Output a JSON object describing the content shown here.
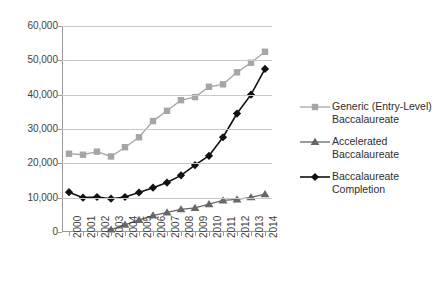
{
  "chart_data": {
    "type": "line",
    "title": "",
    "subtitle": "",
    "xlabel": "",
    "ylabel": "",
    "x": [
      "2000",
      "2001",
      "2002",
      "2003",
      "2004",
      "2005",
      "2006",
      "2007",
      "2008",
      "2009",
      "2010",
      "2011",
      "2012",
      "2013",
      "2014"
    ],
    "categories": [
      "2000",
      "2001",
      "2002",
      "2003",
      "2004",
      "2005",
      "2006",
      "2007",
      "2008",
      "2009",
      "2010",
      "2011",
      "2012",
      "2013",
      "2014"
    ],
    "ylim": [
      0,
      60000
    ],
    "yticks": [
      0,
      10000,
      20000,
      30000,
      40000,
      50000,
      60000
    ],
    "ytick_labels": [
      "0",
      "10,000",
      "20,000",
      "30,000",
      "40,000",
      "50,000",
      "60,000"
    ],
    "grid": true,
    "legend_position": "right",
    "series": [
      {
        "name": "Generic (Entry-Level) Baccalaureate",
        "marker": "square",
        "color": "#a6a6a6",
        "values": [
          22800,
          22500,
          23400,
          22000,
          24700,
          27600,
          32300,
          35300,
          38400,
          39300,
          42300,
          43000,
          46500,
          49300,
          52500
        ]
      },
      {
        "name": "Accelerated Baccalaureate",
        "marker": "triangle",
        "color": "#676767",
        "values": [
          null,
          null,
          null,
          700,
          2100,
          3500,
          4800,
          5700,
          6600,
          7000,
          8100,
          9200,
          9500,
          10100,
          11000
        ]
      },
      {
        "name": "Baccalaureate Completion",
        "marker": "diamond",
        "color": "#111111",
        "values": [
          11600,
          10000,
          10200,
          9700,
          10200,
          11500,
          12900,
          14400,
          16500,
          19500,
          22200,
          27600,
          34500,
          40000,
          47500
        ]
      }
    ]
  },
  "yaxis": {
    "labels": [
      "60,000",
      "50,000",
      "40,000",
      "30,000",
      "20,000",
      "10,000",
      "0"
    ]
  },
  "xaxis": {
    "labels": [
      "2000",
      "2001",
      "2002",
      "2003",
      "2004",
      "2005",
      "2006",
      "2007",
      "2008",
      "2009",
      "2010",
      "2011",
      "2012",
      "2013",
      "2014"
    ]
  },
  "legend": {
    "items": [
      {
        "line1": "Generic (Entry-Level)",
        "line2": "Baccalaureate",
        "marker": "square-marker-icon",
        "color": "#a6a6a6"
      },
      {
        "line1": "Accelerated",
        "line2": "Baccalaureate",
        "marker": "triangle-marker-icon",
        "color": "#676767"
      },
      {
        "line1": "Baccalaureate",
        "line2": "Completion",
        "marker": "diamond-marker-icon",
        "color": "#111111"
      }
    ]
  },
  "colors": {
    "generic": "#a6a6a6",
    "accelerated": "#676767",
    "completion": "#111111",
    "grid": "#c9c9c9",
    "axis": "#9a9a9a",
    "text": "#3f3f3f",
    "background": "#ffffff"
  }
}
